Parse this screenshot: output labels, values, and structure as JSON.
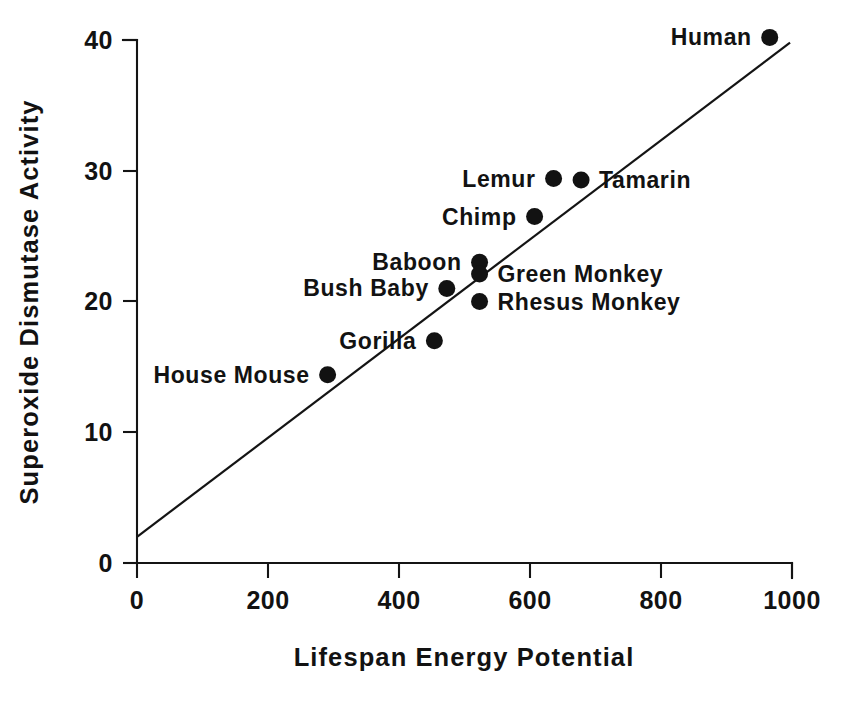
{
  "chart_data": {
    "type": "scatter",
    "title": "",
    "xlabel": "Lifespan Energy Potential",
    "ylabel": "Superoxide Dismutase Activity",
    "xlim": [
      0,
      1000
    ],
    "ylim": [
      0,
      40
    ],
    "xticks": [
      0,
      200,
      400,
      600,
      800,
      1000
    ],
    "yticks": [
      0,
      10,
      20,
      30,
      40
    ],
    "xtick_labels": [
      "0",
      "200",
      "400",
      "600",
      "800",
      "1000"
    ],
    "ytick_labels": [
      "0",
      "10",
      "20",
      "30",
      "40"
    ],
    "grid": false,
    "legend": false,
    "point_color": "#121212",
    "line_color": "#141212",
    "axis_color": "#141414",
    "points": [
      {
        "label": "House Mouse",
        "x": 291,
        "y": 14.4,
        "label_side": "right"
      },
      {
        "label": "Gorilla",
        "x": 454,
        "y": 17.0,
        "label_side": "right"
      },
      {
        "label": "Bush Baby",
        "x": 473,
        "y": 21.0,
        "label_side": "right"
      },
      {
        "label": "Baboon",
        "x": 523,
        "y": 23.0,
        "label_side": "right"
      },
      {
        "label": "Green Monkey",
        "x": 523,
        "y": 22.1,
        "label_side": "left"
      },
      {
        "label": "Rhesus Monkey",
        "x": 523,
        "y": 20.0,
        "label_side": "left"
      },
      {
        "label": "Chimp",
        "x": 607,
        "y": 26.5,
        "label_side": "right"
      },
      {
        "label": "Lemur",
        "x": 636,
        "y": 29.4,
        "label_side": "right"
      },
      {
        "label": "Tamarin",
        "x": 678,
        "y": 29.3,
        "label_side": "left"
      },
      {
        "label": "Human",
        "x": 966,
        "y": 40.2,
        "label_side": "right"
      }
    ],
    "trend_line": {
      "x0": 0,
      "y0": 2.0,
      "x1": 997,
      "y1": 39.8
    }
  }
}
